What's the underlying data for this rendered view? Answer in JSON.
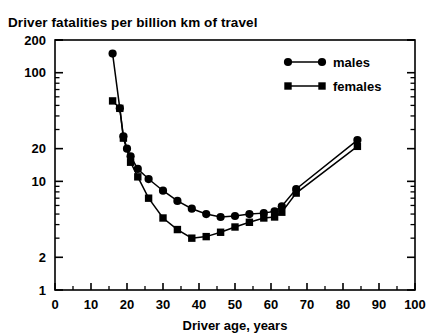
{
  "chart_data": {
    "type": "line",
    "title": "Driver fatalities per billion km of travel",
    "xlabel": "Driver age, years",
    "ylabel": "",
    "xlim": [
      0,
      100
    ],
    "ylim": [
      1,
      200
    ],
    "yscale": "log",
    "xscale": "linear",
    "grid": false,
    "legend_position": "top-right",
    "xticks": [
      0,
      10,
      20,
      30,
      40,
      50,
      60,
      70,
      80,
      90,
      100
    ],
    "xtick_labels": [
      "0",
      "10",
      "20",
      "30",
      "40",
      "50",
      "60",
      "70",
      "80",
      "90",
      "100"
    ],
    "yticks": [
      1,
      2,
      10,
      20,
      100,
      200
    ],
    "ytick_labels": [
      "1",
      "2",
      "10",
      "20",
      "100",
      "200"
    ],
    "series": [
      {
        "name": "males",
        "marker": "circle",
        "color": "#000000",
        "x": [
          16,
          18,
          19,
          20,
          21,
          23,
          26,
          30,
          34,
          38,
          42,
          46,
          50,
          54,
          58,
          61,
          63,
          67,
          84
        ],
        "y": [
          150,
          47,
          26,
          20,
          17,
          13,
          10.5,
          8.2,
          6.6,
          5.6,
          5.0,
          4.7,
          4.8,
          5.0,
          5.1,
          5.3,
          5.9,
          8.5,
          24
        ]
      },
      {
        "name": "females",
        "marker": "square",
        "color": "#000000",
        "x": [
          16,
          18,
          19,
          21,
          23,
          26,
          30,
          34,
          38,
          42,
          46,
          50,
          54,
          58,
          61,
          63,
          67,
          84
        ],
        "y": [
          55,
          47,
          25,
          15,
          11,
          7.0,
          4.6,
          3.6,
          3.0,
          3.1,
          3.4,
          3.8,
          4.2,
          4.6,
          4.7,
          5.2,
          7.8,
          21
        ]
      }
    ]
  },
  "legend": {
    "entries": [
      {
        "label": "males",
        "marker": "circle"
      },
      {
        "label": "females",
        "marker": "square"
      }
    ]
  }
}
